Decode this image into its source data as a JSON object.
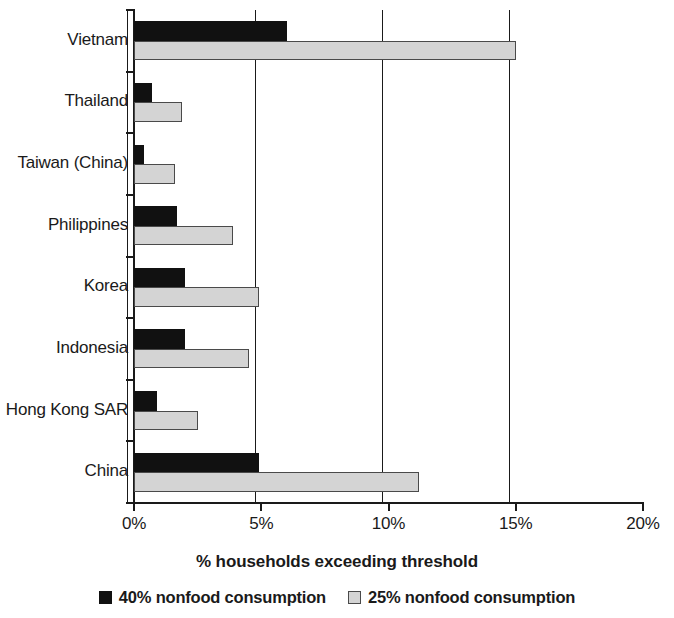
{
  "chart_data": {
    "type": "bar",
    "orientation": "horizontal",
    "title": "",
    "xlabel": "% households exceeding threshold",
    "ylabel": "",
    "xlim": [
      0,
      20
    ],
    "grid": true,
    "legend_position": "bottom",
    "xticks": [
      "0%",
      "5%",
      "10%",
      "15%",
      "20%"
    ],
    "xtick_values": [
      0,
      5,
      10,
      15,
      20
    ],
    "categories": [
      "Vietnam",
      "Thailand",
      "Taiwan (China)",
      "Philippines",
      "Korea",
      "Indonesia",
      "Hong Kong SAR",
      "China"
    ],
    "series": [
      {
        "name": "40% nonfood consumption",
        "color": "#111111",
        "values": [
          6.0,
          0.7,
          0.4,
          1.7,
          2.0,
          2.0,
          0.9,
          4.9
        ]
      },
      {
        "name": "25% nonfood consumption",
        "color": "#d4d4d4",
        "values": [
          15.0,
          1.9,
          1.6,
          3.9,
          4.9,
          4.5,
          2.5,
          11.2
        ]
      }
    ]
  },
  "legend": {
    "items": [
      {
        "label": "40% nonfood consumption",
        "swatch": "dark"
      },
      {
        "label": "25% nonfood consumption",
        "swatch": "light"
      }
    ]
  }
}
